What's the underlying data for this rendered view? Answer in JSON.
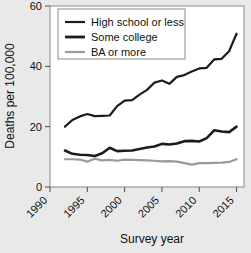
{
  "chart_data": {
    "type": "line",
    "title": "",
    "xlabel": "Survey year",
    "ylabel": "Deaths per 100,000",
    "xlim": [
      1990,
      2016
    ],
    "ylim": [
      0,
      60
    ],
    "xticks": [
      "1990",
      "1995",
      "2000",
      "2005",
      "2010",
      "2015"
    ],
    "xtick_values": [
      1990,
      1995,
      2000,
      2005,
      2010,
      2015
    ],
    "yticks": [
      "0",
      "20",
      "40",
      "60"
    ],
    "ytick_values": [
      0,
      20,
      40,
      60
    ],
    "grid": false,
    "legend_position": "top-left",
    "x": [
      1992,
      1993,
      1994,
      1995,
      1996,
      1997,
      1998,
      1999,
      2000,
      2001,
      2002,
      2003,
      2004,
      2005,
      2006,
      2007,
      2008,
      2009,
      2010,
      2011,
      2012,
      2013,
      2014,
      2015
    ],
    "series": [
      {
        "name": "High school or less",
        "color": "#1c1c1c",
        "width": 2.2,
        "values": [
          20.0,
          22.2,
          23.4,
          24.2,
          23.5,
          23.6,
          23.7,
          26.8,
          28.6,
          28.8,
          30.6,
          32.2,
          34.6,
          35.3,
          34.2,
          36.5,
          37.1,
          38.3,
          39.3,
          39.5,
          42.3,
          42.5,
          45.0,
          50.8
        ]
      },
      {
        "name": "Some college",
        "color": "#1c1c1c",
        "width": 2.6,
        "values": [
          12.1,
          11.0,
          10.7,
          10.6,
          10.3,
          11.2,
          13.0,
          11.9,
          12.0,
          12.1,
          12.6,
          13.1,
          13.4,
          14.3,
          14.1,
          14.4,
          15.2,
          15.3,
          15.1,
          16.2,
          18.8,
          18.4,
          18.2,
          20.0
        ]
      },
      {
        "name": "BA or more",
        "color": "#9a9a9a",
        "width": 2.2,
        "values": [
          9.2,
          9.2,
          9.1,
          8.4,
          9.4,
          8.8,
          9.0,
          8.7,
          9.1,
          9.0,
          8.9,
          8.8,
          8.7,
          8.5,
          8.6,
          8.4,
          7.9,
          7.4,
          7.9,
          7.9,
          8.0,
          8.1,
          8.3,
          9.2
        ]
      }
    ],
    "legend": [
      {
        "label": "High school or less",
        "color": "#1c1c1c"
      },
      {
        "label": "Some college",
        "color": "#1c1c1c"
      },
      {
        "label": "BA or more",
        "color": "#9a9a9a"
      }
    ],
    "colors": {
      "figure_background": "#e9e9e9",
      "plot_background": "#ffffff",
      "axis": "#4a4a4a",
      "text": "#111111"
    }
  }
}
